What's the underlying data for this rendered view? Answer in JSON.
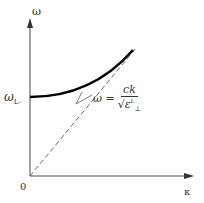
{
  "diagram": {
    "type": "dispersion-relation",
    "y_axis_label": "ω",
    "x_axis_label": "κ",
    "origin_label": "0",
    "cutoff_label": "ω",
    "cutoff_subscript": "L-",
    "line_label": {
      "lhs": "ω =",
      "numerator": "ck",
      "denominator_base": "ε",
      "denominator_sup": "L",
      "denominator_sub": "⊥",
      "sqrt_symbol": "√"
    },
    "colors": {
      "axes": "#555555",
      "curve": "#000000",
      "light_line": "#555555"
    }
  }
}
